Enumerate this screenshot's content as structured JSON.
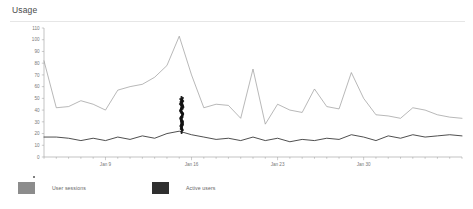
{
  "card": {
    "title": "Usage"
  },
  "legend": {
    "items": [
      {
        "label": "User sessions",
        "color": "#8c8c8c"
      },
      {
        "label": "Active users",
        "color": "#2f2f2f"
      }
    ]
  },
  "annotation": {
    "name": "ink-scribble",
    "description": "dark hand-drawn vertical ink mark over chart near Jan 16",
    "color": "#111111"
  },
  "chart_data": {
    "type": "line",
    "title": "Usage",
    "xlabel": "",
    "ylabel": "",
    "ylim": [
      0,
      110
    ],
    "ytick_interval": 10,
    "ytick_labels": [
      "0",
      "10",
      "20",
      "30",
      "40",
      "50",
      "60",
      "70",
      "80",
      "90",
      "100",
      "110"
    ],
    "grid": false,
    "legend_position": "bottom",
    "x": [
      "Jan 4",
      "Jan 5",
      "Jan 6",
      "Jan 7",
      "Jan 8",
      "Jan 9",
      "Jan 10",
      "Jan 11",
      "Jan 12",
      "Jan 13",
      "Jan 14",
      "Jan 15",
      "Jan 16",
      "Jan 17",
      "Jan 18",
      "Jan 19",
      "Jan 20",
      "Jan 21",
      "Jan 22",
      "Jan 23",
      "Jan 24",
      "Jan 25",
      "Jan 26",
      "Jan 27",
      "Jan 28",
      "Jan 29",
      "Jan 30",
      "Jan 31",
      "Feb 1",
      "Feb 2",
      "Feb 3",
      "Feb 4",
      "Feb 5",
      "Feb 6",
      "Feb 7"
    ],
    "xtick_labels": [
      "Jan 9",
      "Jan 16",
      "Jan 23",
      "Jan 30"
    ],
    "xtick_indices": [
      5,
      12,
      19,
      26
    ],
    "series": [
      {
        "name": "User sessions",
        "color": "#8c8c8c",
        "values": [
          82,
          42,
          43,
          48,
          45,
          40,
          57,
          60,
          62,
          68,
          78,
          103,
          70,
          42,
          45,
          44,
          33,
          75,
          28,
          45,
          40,
          38,
          58,
          43,
          41,
          72,
          50,
          36,
          35,
          33,
          42,
          40,
          36,
          34,
          33
        ]
      },
      {
        "name": "Active users",
        "color": "#2f2f2f",
        "values": [
          17,
          17,
          16,
          14,
          16,
          14,
          17,
          15,
          18,
          16,
          20,
          22,
          19,
          17,
          15,
          16,
          14,
          17,
          14,
          16,
          13,
          15,
          14,
          16,
          15,
          19,
          17,
          14,
          18,
          16,
          19,
          17,
          18,
          19,
          18
        ]
      }
    ]
  }
}
